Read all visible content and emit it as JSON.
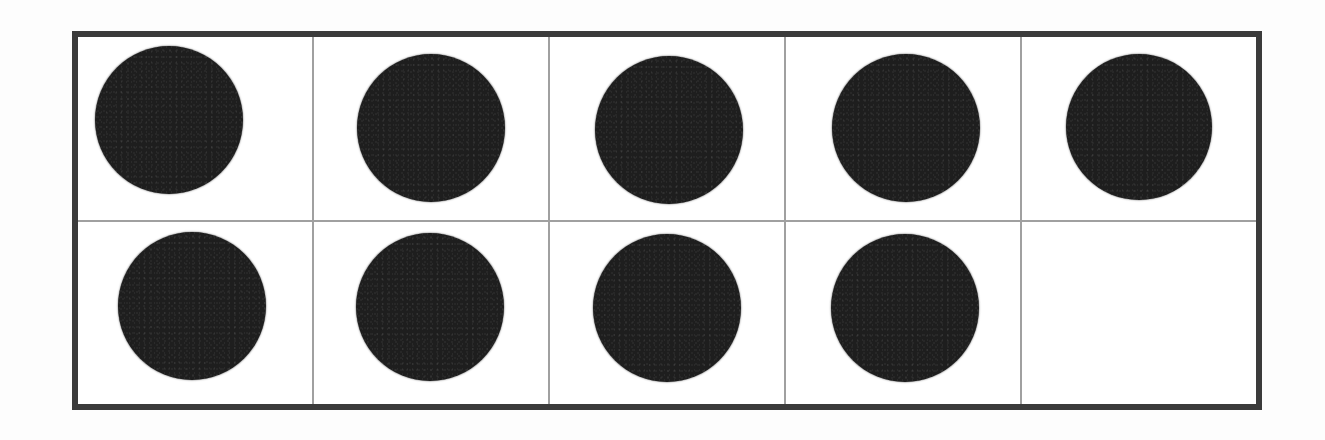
{
  "worksheet": {
    "type": "ten-frame",
    "title": "Ten Frame",
    "rows": 2,
    "columns": 5,
    "total_cells": 10,
    "filled_count": 9,
    "empty_count": 1,
    "represented_number": "9"
  },
  "colors": {
    "page_background": "#ffffff",
    "frame_background": "#ffffff",
    "outer_border": "#3b3b3b",
    "inner_divider": "#a0a0a0",
    "counter_fill": "#1e1e1e"
  },
  "geometry": {
    "frame_left": 72,
    "frame_top": 31,
    "frame_width": 1190,
    "frame_height": 379,
    "outer_border_width": 6,
    "inner_divider_width": 2
  },
  "cells": [
    {
      "id": "r1c1",
      "row": 1,
      "column": 1,
      "filled": true,
      "label": "counter",
      "dot": {
        "left": 17,
        "top": 9,
        "size": 148
      }
    },
    {
      "id": "r1c2",
      "row": 1,
      "column": 2,
      "filled": true,
      "label": "counter",
      "dot": {
        "left": 43,
        "top": 17,
        "size": 148
      }
    },
    {
      "id": "r1c3",
      "row": 1,
      "column": 3,
      "filled": true,
      "label": "counter",
      "dot": {
        "left": 45,
        "top": 19,
        "size": 148
      }
    },
    {
      "id": "r1c4",
      "row": 1,
      "column": 4,
      "filled": true,
      "label": "counter",
      "dot": {
        "left": 46,
        "top": 17,
        "size": 148
      }
    },
    {
      "id": "r1c5",
      "row": 1,
      "column": 5,
      "filled": true,
      "label": "counter",
      "dot": {
        "left": 44,
        "top": 17,
        "size": 146
      }
    },
    {
      "id": "r2c1",
      "row": 2,
      "column": 1,
      "filled": true,
      "label": "counter",
      "dot": {
        "left": 40,
        "top": 10,
        "size": 148
      }
    },
    {
      "id": "r2c2",
      "row": 2,
      "column": 2,
      "filled": true,
      "label": "counter",
      "dot": {
        "left": 42,
        "top": 11,
        "size": 148
      }
    },
    {
      "id": "r2c3",
      "row": 2,
      "column": 3,
      "filled": true,
      "label": "counter",
      "dot": {
        "left": 43,
        "top": 12,
        "size": 148
      }
    },
    {
      "id": "r2c4",
      "row": 2,
      "column": 4,
      "filled": true,
      "label": "counter",
      "dot": {
        "left": 45,
        "top": 12,
        "size": 148
      }
    },
    {
      "id": "r2c5",
      "row": 2,
      "column": 5,
      "filled": false,
      "label": "empty-cell",
      "dot": null
    }
  ]
}
